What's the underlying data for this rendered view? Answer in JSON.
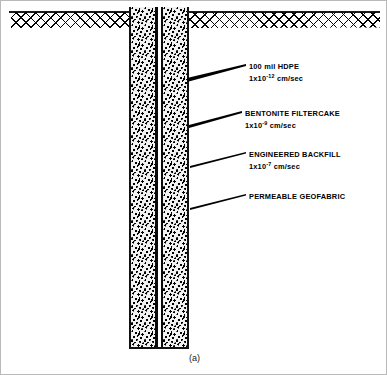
{
  "figure": {
    "caption": "(a)",
    "ground_line_color": "#1a1a1a",
    "fill_color": "#0a0a0a"
  },
  "callouts": [
    {
      "id": "hdpe",
      "title": "100 mil HDPE",
      "value_mantissa": "1x10",
      "value_exponent": "-12",
      "value_units": " cm/sec"
    },
    {
      "id": "bentonite",
      "title": "BENTONITE FILTERCAKE",
      "value_mantissa": "1x10",
      "value_exponent": "-9",
      "value_units": " cm/sec"
    },
    {
      "id": "backfill",
      "title": "ENGINEERED BACKFILL",
      "value_mantissa": "1x10",
      "value_exponent": "-7",
      "value_units": " cm/sec"
    },
    {
      "id": "geofabric",
      "title": "PERMEABLE GEOFABRIC",
      "value_mantissa": "",
      "value_exponent": "",
      "value_units": ""
    }
  ]
}
